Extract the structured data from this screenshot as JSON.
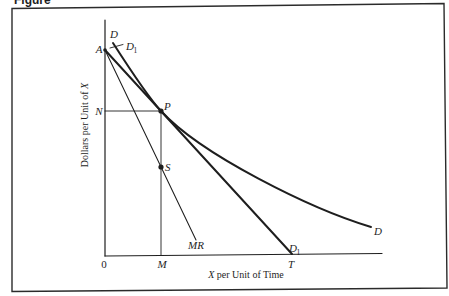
{
  "figure": {
    "caption": "Figure"
  },
  "colors": {
    "background": "#ffffff",
    "ink": "#1e1e1e",
    "frame": "#2b2b2b"
  },
  "axes": {
    "x": {
      "title_var": "X",
      "title_rest": " per Unit of Time",
      "origin_label": "0",
      "tick_labels": {
        "M": "M",
        "T": "T"
      }
    },
    "y": {
      "title_rest": "Dollars per Unit of ",
      "title_var": "X",
      "tick_labels": {
        "A": "A",
        "N": "N"
      }
    }
  },
  "curves": {
    "D": {
      "label": "D",
      "description": "Curved demand curve, tangent to D1 at P"
    },
    "D1": {
      "label": "D",
      "subscript": "1",
      "description": "Straight line from A to T, tangent to D at P"
    },
    "MR": {
      "label": "MR",
      "description": "Marginal revenue line from A through S"
    }
  },
  "points": {
    "P": {
      "label": "P",
      "cx": 161,
      "cy": 111
    },
    "S": {
      "label": "S",
      "cx": 161,
      "cy": 167
    },
    "A": {
      "label": "A",
      "cx": 105,
      "cy": 50
    }
  },
  "geometry": {
    "frame": "12,8.5 444,3.5 447,288 12,291.5",
    "y_axis": "M105,20 L105,256",
    "x_axis": "M105,256 L382,253.5",
    "n_guide": "M105,111 L161,111",
    "m_guide": "M161,111 L161,255.5",
    "mr": "M105,50 L196,240",
    "d1": "M105,50 L292,254",
    "d": "M113,43 C122,57 148,97 161,111 C201,154.7 311,209 371,227",
    "d1_leader": "M110,48 L123,44.5"
  }
}
